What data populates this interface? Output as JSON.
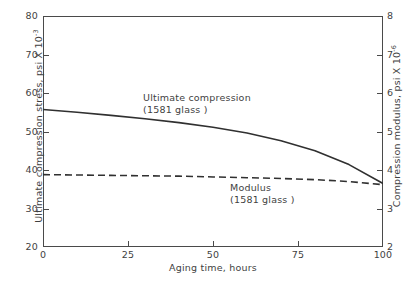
{
  "chart_data": {
    "type": "line",
    "title": "",
    "xlabel": "Aging  time, hours",
    "ylabel_left": "Ultimate compression stress, psi X 10",
    "ylabel_left_exponent": "-3",
    "ylabel_right": "Compression modulus, psi X 10",
    "ylabel_right_exponent": "-6",
    "xlim": [
      0,
      100
    ],
    "ylim_left": [
      20,
      80
    ],
    "ylim_right": [
      2,
      8
    ],
    "xticks": [
      0,
      25,
      50,
      75,
      100
    ],
    "yticks_left": [
      20,
      30,
      40,
      50,
      60,
      70,
      80
    ],
    "yticks_right": [
      2,
      3,
      4,
      5,
      6,
      7,
      8
    ],
    "grid": false,
    "legend": "in-plot annotations",
    "line_color": "#303030",
    "frame_color": "#4a4a4a",
    "series": [
      {
        "name": "Ultimate compression (1581 glass)",
        "axis": "left",
        "style": "solid",
        "x": [
          0,
          10,
          20,
          30,
          40,
          50,
          60,
          70,
          80,
          90,
          100
        ],
        "values": [
          55.7,
          55.0,
          54.2,
          53.3,
          52.3,
          51.1,
          49.6,
          47.6,
          45.0,
          41.4,
          36.5
        ]
      },
      {
        "name": "Modulus (1581 glass)",
        "axis": "right",
        "style": "dashed",
        "x": [
          0,
          10,
          20,
          30,
          40,
          50,
          60,
          70,
          80,
          90,
          100
        ],
        "values": [
          3.88,
          3.87,
          3.86,
          3.85,
          3.84,
          3.82,
          3.8,
          3.78,
          3.75,
          3.7,
          3.62
        ]
      }
    ],
    "annotations": [
      {
        "name": "ultimate-compression",
        "line1": "Ultimate  compression",
        "line2": "(1581 glass )"
      },
      {
        "name": "modulus",
        "line1": "Modulus",
        "line2": "(1581 glass )"
      }
    ]
  },
  "axes": {
    "left": {
      "title_text": "Ultimate compression stress, psi X 10",
      "title_exponent": "-3",
      "ticks": [
        {
          "label": "80",
          "value": 80
        },
        {
          "label": "70",
          "value": 70
        },
        {
          "label": "60",
          "value": 60
        },
        {
          "label": "50",
          "value": 50
        },
        {
          "label": "40",
          "value": 40
        },
        {
          "label": "30",
          "value": 30
        },
        {
          "label": "20",
          "value": 20
        }
      ]
    },
    "right": {
      "title_text": "Compression modulus, psi X 10",
      "title_exponent": "-6",
      "ticks": [
        {
          "label": "8",
          "value": 8
        },
        {
          "label": "7",
          "value": 7
        },
        {
          "label": "6",
          "value": 6
        },
        {
          "label": "5",
          "value": 5
        },
        {
          "label": "4",
          "value": 4
        },
        {
          "label": "3",
          "value": 3
        },
        {
          "label": "2",
          "value": 2
        }
      ]
    },
    "bottom": {
      "title": "Aging  time, hours",
      "ticks": [
        {
          "label": "0",
          "value": 0
        },
        {
          "label": "25",
          "value": 25
        },
        {
          "label": "50",
          "value": 50
        },
        {
          "label": "75",
          "value": 75
        },
        {
          "label": "100",
          "value": 100
        }
      ]
    }
  },
  "page": {
    "caption_remnant": ""
  }
}
